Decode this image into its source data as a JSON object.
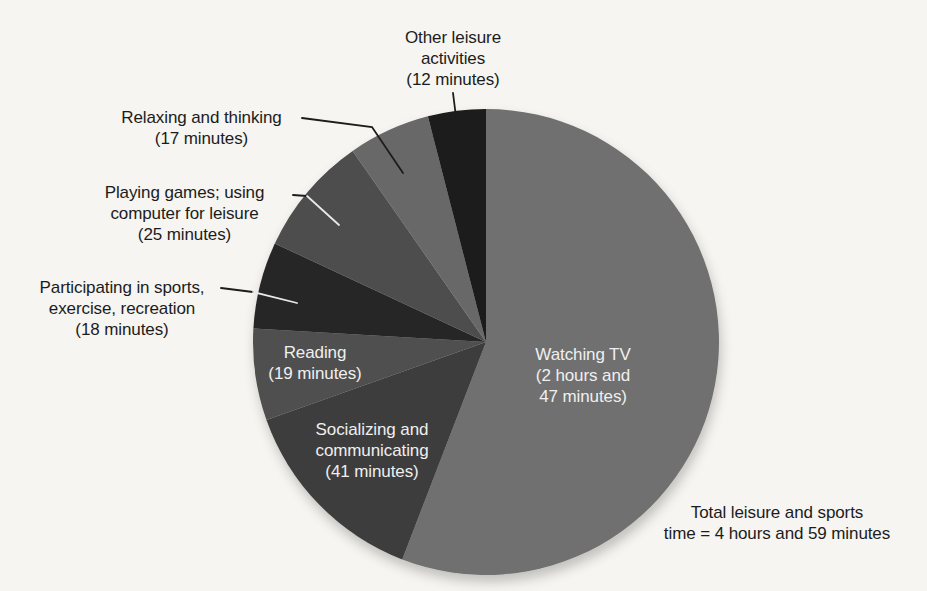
{
  "page": {
    "background_color": "#f6f5f1",
    "text_color": "#1c1c1c",
    "inside_label_color": "#efefef"
  },
  "chart_data": {
    "type": "pie",
    "title": "",
    "unit": "minutes",
    "start_angle_deg": 0,
    "direction": "clockwise",
    "total_minutes": 299,
    "annotation": "Total leisure and sports time = 4 hours and 59 minutes",
    "total_label_lines": [
      "Total leisure and sports",
      "time = 4 hours and 59 minutes"
    ],
    "slices": [
      {
        "name": "Watching TV",
        "minutes": 167,
        "duration_text": "2 hours and 47 minutes",
        "color": "#707070",
        "label_placement": "inside",
        "label_lines": [
          "Watching TV",
          "(2 hours and",
          "47 minutes)"
        ]
      },
      {
        "name": "Socializing and communicating",
        "minutes": 41,
        "duration_text": "41 minutes",
        "color": "#3d3d3d",
        "label_placement": "inside",
        "label_lines": [
          "Socializing and",
          "communicating",
          "(41 minutes)"
        ]
      },
      {
        "name": "Reading",
        "minutes": 19,
        "duration_text": "19 minutes",
        "color": "#4f4f4f",
        "label_placement": "inside",
        "label_lines": [
          "Reading",
          "(19 minutes)"
        ]
      },
      {
        "name": "Participating in sports, exercise, recreation",
        "minutes": 18,
        "duration_text": "18 minutes",
        "color": "#282828",
        "label_placement": "outside",
        "label_lines": [
          "Participating in sports,",
          "exercise, recreation",
          "(18 minutes)"
        ]
      },
      {
        "name": "Playing games; using computer for leisure",
        "minutes": 25,
        "duration_text": "25 minutes",
        "color": "#4d4d4d",
        "label_placement": "outside",
        "label_lines": [
          "Playing games; using",
          "computer for leisure",
          "(25 minutes)"
        ]
      },
      {
        "name": "Relaxing and thinking",
        "minutes": 17,
        "duration_text": "17 minutes",
        "color": "#686868",
        "label_placement": "outside",
        "label_lines": [
          "Relaxing and thinking",
          "(17 minutes)"
        ]
      },
      {
        "name": "Other leisure activities",
        "minutes": 12,
        "duration_text": "12 minutes",
        "color": "#1a1a1a",
        "label_placement": "outside",
        "label_lines": [
          "Other leisure",
          "activities",
          "(12 minutes)"
        ]
      }
    ]
  }
}
